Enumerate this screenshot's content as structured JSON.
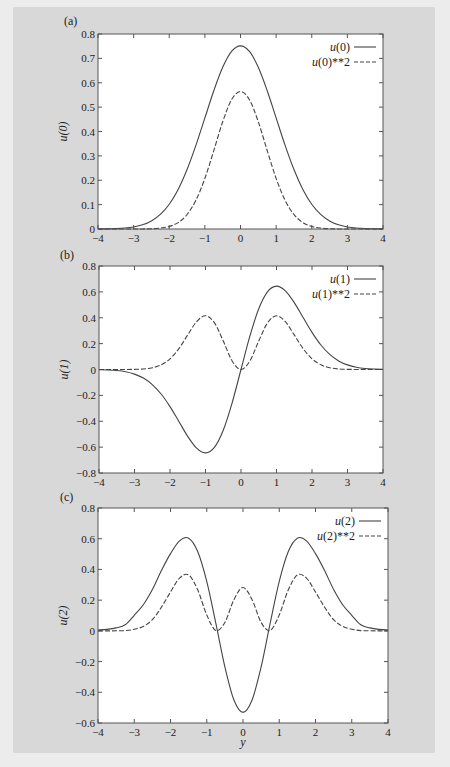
{
  "figure": {
    "background": "#ececec",
    "frame_color": "#d8d8d8",
    "plot_bg": "#ffffff",
    "line_color": "#444444",
    "xlabel": "y"
  },
  "chart_data": [
    {
      "type": "line",
      "panel_label": "(a)",
      "title": "",
      "xlabel": "",
      "ylabel": "u(0)",
      "xlim": [
        -4,
        4
      ],
      "ylim": [
        0,
        0.8
      ],
      "xticks": [
        -4,
        -3,
        -2,
        -1,
        0,
        1,
        2,
        3,
        4
      ],
      "xtick_labels": [
        "−4",
        "−3",
        "−2",
        "−1",
        "0",
        "1",
        "2",
        "3",
        "4"
      ],
      "yticks": [
        0,
        0.1,
        0.2,
        0.3,
        0.4,
        0.5,
        0.6,
        0.7,
        0.8
      ],
      "ytick_labels": [
        "0",
        "0.1",
        "0.2",
        "0.3",
        "0.4",
        "0.5",
        "0.6",
        "0.7",
        "0.8"
      ],
      "grid": false,
      "legend_position": "top-right",
      "x": [
        -4,
        -3.75,
        -3.5,
        -3.25,
        -3,
        -2.75,
        -2.5,
        -2.25,
        -2,
        -1.75,
        -1.5,
        -1.25,
        -1,
        -0.75,
        -0.5,
        -0.25,
        0,
        0.25,
        0.5,
        0.75,
        1,
        1.25,
        1.5,
        1.75,
        2,
        2.25,
        2.5,
        2.75,
        3,
        3.25,
        3.5,
        3.75,
        4
      ],
      "series": [
        {
          "name": "u(0)",
          "legend_label": "u(0)",
          "style": "solid",
          "values": [
            0.0003,
            0.0007,
            0.0016,
            0.0038,
            0.0084,
            0.0171,
            0.0329,
            0.0596,
            0.1016,
            0.1623,
            0.2438,
            0.3439,
            0.4556,
            0.5671,
            0.6632,
            0.7284,
            0.7511,
            0.7284,
            0.6632,
            0.5671,
            0.4556,
            0.3439,
            0.2438,
            0.1623,
            0.1016,
            0.0596,
            0.0329,
            0.0171,
            0.0084,
            0.0038,
            0.0016,
            0.0007,
            0.0003
          ]
        },
        {
          "name": "u(0)**2",
          "legend_label": "u(0)**2",
          "style": "dashed",
          "values": [
            0.0,
            0.0,
            0.0,
            0.0,
            0.0001,
            0.0003,
            0.0011,
            0.0036,
            0.0103,
            0.0263,
            0.0594,
            0.1183,
            0.2076,
            0.3216,
            0.4398,
            0.5306,
            0.5642,
            0.5306,
            0.4398,
            0.3216,
            0.2076,
            0.1183,
            0.0594,
            0.0263,
            0.0103,
            0.0036,
            0.0011,
            0.0003,
            0.0001,
            0.0,
            0.0,
            0.0,
            0.0
          ]
        }
      ]
    },
    {
      "type": "line",
      "panel_label": "(b)",
      "title": "",
      "xlabel": "",
      "ylabel": "u(1)",
      "xlim": [
        -4,
        4
      ],
      "ylim": [
        -0.8,
        0.8
      ],
      "xticks": [
        -4,
        -3,
        -2,
        -1,
        0,
        1,
        2,
        3,
        4
      ],
      "xtick_labels": [
        "−4",
        "−3",
        "−2",
        "−1",
        "0",
        "1",
        "2",
        "3",
        "4"
      ],
      "yticks": [
        -0.8,
        -0.6,
        -0.4,
        -0.2,
        0,
        0.2,
        0.4,
        0.6,
        0.8
      ],
      "ytick_labels": [
        "−0.8",
        "−0.6",
        "−0.4",
        "−0.2",
        "0",
        "0.2",
        "0.4",
        "0.6",
        "0.8"
      ],
      "grid": false,
      "legend_position": "top-right",
      "x": [
        -4,
        -3.75,
        -3.5,
        -3.25,
        -3,
        -2.75,
        -2.5,
        -2.25,
        -2,
        -1.75,
        -1.5,
        -1.25,
        -1,
        -0.75,
        -0.5,
        -0.25,
        0,
        0.25,
        0.5,
        0.75,
        1,
        1.25,
        1.5,
        1.75,
        2,
        2.25,
        2.5,
        2.75,
        3,
        3.25,
        3.5,
        3.75,
        4
      ],
      "series": [
        {
          "name": "u(1)",
          "legend_label": "u(1)",
          "style": "solid",
          "values": [
            -0.0019,
            -0.0037,
            -0.0079,
            -0.0174,
            -0.0356,
            -0.0664,
            -0.1163,
            -0.1896,
            -0.2873,
            -0.4017,
            -0.5172,
            -0.6079,
            -0.6443,
            -0.6015,
            -0.469,
            -0.2575,
            0.0,
            0.2575,
            0.469,
            0.6015,
            0.6443,
            0.6079,
            0.5172,
            0.4017,
            0.2873,
            0.1896,
            0.1163,
            0.0664,
            0.0356,
            0.0174,
            0.0079,
            0.0037,
            0.0019
          ]
        },
        {
          "name": "u(1)**2",
          "legend_label": "u(1)**2",
          "style": "dashed",
          "values": [
            0.0,
            0.0,
            0.0001,
            0.0003,
            0.0013,
            0.0044,
            0.0135,
            0.0359,
            0.0825,
            0.1614,
            0.2675,
            0.3695,
            0.4151,
            0.3618,
            0.22,
            0.0663,
            0.0,
            0.0663,
            0.22,
            0.3618,
            0.4151,
            0.3695,
            0.2675,
            0.1614,
            0.0825,
            0.0359,
            0.0135,
            0.0044,
            0.0013,
            0.0003,
            0.0001,
            0.0,
            0.0
          ]
        }
      ]
    },
    {
      "type": "line",
      "panel_label": "(c)",
      "title": "",
      "xlabel": "y",
      "ylabel": "u(2)",
      "xlim": [
        -4,
        4
      ],
      "ylim": [
        -0.6,
        0.8
      ],
      "xticks": [
        -4,
        -3,
        -2,
        -1,
        0,
        1,
        2,
        3,
        4
      ],
      "xtick_labels": [
        "−4",
        "−3",
        "−2",
        "−1",
        "0",
        "1",
        "2",
        "3",
        "4"
      ],
      "yticks": [
        -0.6,
        -0.4,
        -0.2,
        0,
        0.2,
        0.4,
        0.6,
        0.8
      ],
      "ytick_labels": [
        "−0.6",
        "−0.4",
        "−0.2",
        "0",
        "0.2",
        "0.4",
        "0.6",
        "0.8"
      ],
      "grid": false,
      "legend_position": "top-right",
      "x": [
        -4,
        -3.75,
        -3.5,
        -3.25,
        -3,
        -2.75,
        -2.5,
        -2.25,
        -2,
        -1.75,
        -1.5,
        -1.25,
        -1,
        -0.75,
        -0.5,
        -0.25,
        0,
        0.25,
        0.5,
        0.75,
        1,
        1.25,
        1.5,
        1.75,
        2,
        2.25,
        2.5,
        2.75,
        3,
        3.25,
        3.5,
        3.75,
        4
      ],
      "series": [
        {
          "name": "u(2)",
          "legend_label": "u(2)",
          "style": "solid",
          "values": [
            0.0055,
            0.0098,
            0.0194,
            0.0393,
            0.1013,
            0.1702,
            0.2694,
            0.3931,
            0.503,
            0.5863,
            0.6034,
            0.5168,
            0.3222,
            0.05,
            -0.2345,
            -0.4507,
            -0.5311,
            -0.4507,
            -0.2345,
            0.05,
            0.3222,
            0.5168,
            0.6034,
            0.5863,
            0.503,
            0.3931,
            0.2694,
            0.1702,
            0.1013,
            0.0393,
            0.0194,
            0.0098,
            0.0055
          ]
        },
        {
          "name": "u(2)**2",
          "legend_label": "u(2)**2",
          "style": "dashed",
          "values": [
            0.0,
            0.0001,
            0.0004,
            0.0015,
            0.0103,
            0.029,
            0.0726,
            0.1545,
            0.253,
            0.3437,
            0.3641,
            0.2671,
            0.1038,
            0.0025,
            0.055,
            0.2031,
            0.2821,
            0.2031,
            0.055,
            0.0025,
            0.1038,
            0.2671,
            0.3641,
            0.3437,
            0.253,
            0.1545,
            0.0726,
            0.029,
            0.0103,
            0.0015,
            0.0004,
            0.0001,
            0.0
          ]
        }
      ]
    }
  ]
}
